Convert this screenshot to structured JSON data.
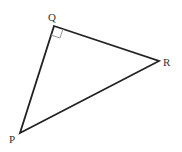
{
  "diagram": {
    "type": "right-triangle",
    "stroke_color": "#222222",
    "right_angle_marker_color": "#999999",
    "vertices": {
      "Q": {
        "label": "Q",
        "x": 54,
        "y": 26
      },
      "R": {
        "label": "R",
        "x": 159,
        "y": 61
      },
      "P": {
        "label": "P",
        "x": 20,
        "y": 133
      }
    },
    "right_angle_at": "Q"
  }
}
